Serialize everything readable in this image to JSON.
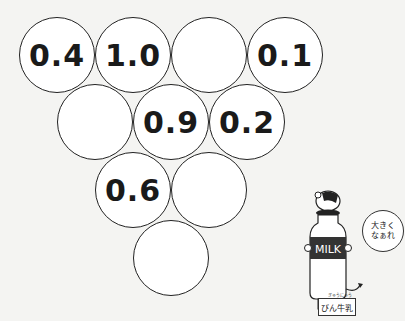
{
  "puzzle": {
    "circles": [
      {
        "row": 1,
        "col": 1,
        "value": "0.4"
      },
      {
        "row": 1,
        "col": 2,
        "value": "1.0"
      },
      {
        "row": 1,
        "col": 3,
        "value": ""
      },
      {
        "row": 1,
        "col": 4,
        "value": "0.1"
      },
      {
        "row": 2,
        "col": 1,
        "value": ""
      },
      {
        "row": 2,
        "col": 2,
        "value": "0.9"
      },
      {
        "row": 2,
        "col": 3,
        "value": "0.2"
      },
      {
        "row": 3,
        "col": 1,
        "value": "0.6"
      },
      {
        "row": 3,
        "col": 2,
        "value": ""
      },
      {
        "row": 4,
        "col": 1,
        "value": ""
      }
    ]
  },
  "character": {
    "bottle_text": "MILK",
    "speech_line1": "大きく",
    "speech_line2": "なぁれ",
    "speech_ruby": "おお",
    "name_label": "びん牛乳",
    "name_ruby": "ぎゅうにゅう"
  }
}
